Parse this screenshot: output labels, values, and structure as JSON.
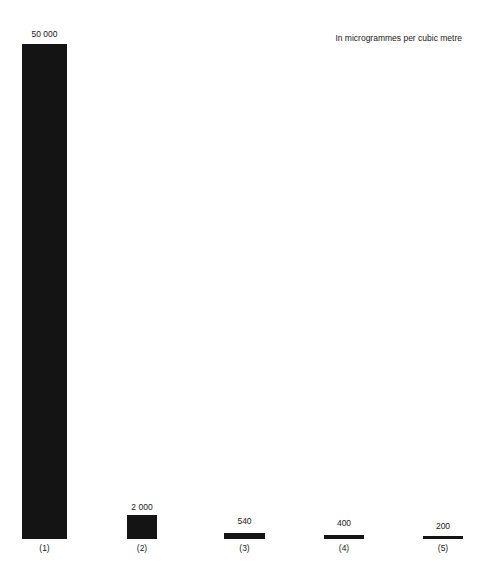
{
  "chart_data": {
    "type": "bar",
    "title": "",
    "subtitle": "",
    "unit_note": "In microgrammes per cubic metre",
    "xlabel": "",
    "ylabel": "",
    "grid": false,
    "legend": "none",
    "ylim": [
      0,
      50000
    ],
    "categories": [
      "(1)",
      "(2)",
      "(3)",
      "(4)",
      "(5)"
    ],
    "values": [
      50000,
      2000,
      540,
      400,
      200
    ],
    "value_labels": [
      "50 000",
      "2 000",
      "540",
      "400",
      "200"
    ],
    "bar_color": "#141414",
    "background_color": "#ffffff",
    "bars": [
      {
        "category": "(1)",
        "value": 50000,
        "value_label": "50 000",
        "left_px": 22,
        "width_px": 45,
        "height_px": 495,
        "label_top_px": 29
      },
      {
        "category": "(2)",
        "value": 2000,
        "value_label": "2 000",
        "left_px": 127,
        "width_px": 30,
        "height_px": 24,
        "label_top_px": 502
      },
      {
        "category": "(3)",
        "value": 540,
        "value_label": "540",
        "left_px": 224,
        "width_px": 41,
        "height_px": 6,
        "label_top_px": 516
      },
      {
        "category": "(4)",
        "value": 400,
        "value_label": "400",
        "left_px": 324,
        "width_px": 40,
        "height_px": 4,
        "label_top_px": 518
      },
      {
        "category": "(5)",
        "value": 200,
        "value_label": "200",
        "left_px": 423,
        "width_px": 40,
        "height_px": 3,
        "label_top_px": 521
      }
    ]
  }
}
